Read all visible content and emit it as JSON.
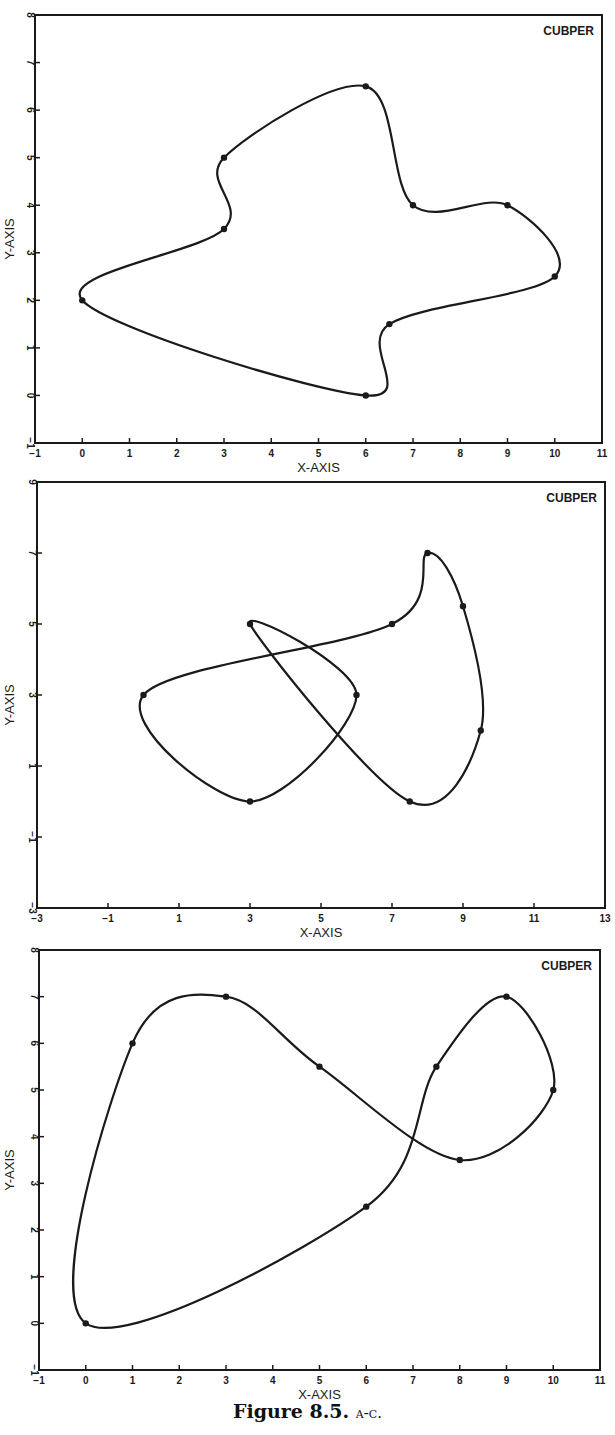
{
  "caption": {
    "figure": "Figure 8.5.",
    "parts": "a-c."
  },
  "chart_data": [
    {
      "id": "a",
      "type": "line",
      "title": "",
      "annotation": "CUBPER",
      "xlabel": "X-AXIS",
      "ylabel": "Y-AXIS",
      "xlim": [
        -1,
        11
      ],
      "ylim": [
        -1,
        8
      ],
      "xticks": [
        -1,
        0,
        1,
        2,
        3,
        4,
        5,
        6,
        7,
        8,
        9,
        10,
        11
      ],
      "yticks": [
        -1,
        0,
        1,
        2,
        3,
        4,
        5,
        6,
        7,
        8
      ],
      "closed": true,
      "grid": false,
      "points": [
        [
          0,
          2
        ],
        [
          3,
          3.5
        ],
        [
          3,
          5
        ],
        [
          6,
          6.5
        ],
        [
          7,
          4
        ],
        [
          9,
          4
        ],
        [
          10,
          2.5
        ],
        [
          6.5,
          1.5
        ],
        [
          6,
          0
        ]
      ],
      "frame": {
        "left": 35,
        "right": 602,
        "top": 15,
        "bottom": 443
      }
    },
    {
      "id": "b",
      "type": "line",
      "title": "",
      "annotation": "CUBPER",
      "xlabel": "X-AXIS",
      "ylabel": "Y-AXIS",
      "xlim": [
        -3,
        13
      ],
      "ylim": [
        -3,
        9
      ],
      "xticks": [
        -3,
        -1,
        1,
        3,
        5,
        7,
        9,
        11,
        13
      ],
      "yticks": [
        -3,
        -1,
        1,
        3,
        5,
        7,
        9
      ],
      "closed": true,
      "grid": false,
      "points": [
        [
          0,
          3
        ],
        [
          3,
          0
        ],
        [
          6,
          3
        ],
        [
          3,
          5
        ],
        [
          7.5,
          0
        ],
        [
          9.5,
          2
        ],
        [
          9,
          5.5
        ],
        [
          8,
          7
        ],
        [
          7,
          5
        ]
      ],
      "frame": {
        "left": 37,
        "right": 605,
        "top": 482,
        "bottom": 908
      }
    },
    {
      "id": "c",
      "type": "line",
      "title": "",
      "annotation": "CUBPER",
      "xlabel": "X-AXIS",
      "ylabel": "Y-AXIS",
      "xlim": [
        -1,
        11
      ],
      "ylim": [
        -1,
        8
      ],
      "xticks": [
        -1,
        0,
        1,
        2,
        3,
        4,
        5,
        6,
        7,
        8,
        9,
        10,
        11
      ],
      "yticks": [
        -1,
        0,
        1,
        2,
        3,
        4,
        5,
        6,
        7,
        8
      ],
      "closed": true,
      "grid": false,
      "points": [
        [
          0,
          0
        ],
        [
          1,
          6
        ],
        [
          3,
          7
        ],
        [
          5,
          5.5
        ],
        [
          8,
          3.5
        ],
        [
          10,
          5
        ],
        [
          9,
          7
        ],
        [
          7.5,
          5.5
        ],
        [
          6,
          2.5
        ]
      ],
      "frame": {
        "left": 39,
        "right": 600,
        "top": 950,
        "bottom": 1370
      }
    }
  ]
}
